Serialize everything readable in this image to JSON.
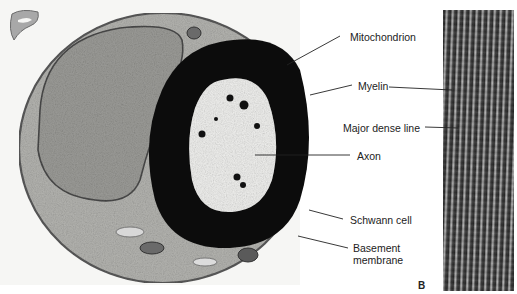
{
  "figure": {
    "panel_label": "B",
    "labels": {
      "mitochondrion": "Mitochondrion",
      "myelin": "Myelin",
      "major_dense_line": "Major dense line",
      "axon": "Axon",
      "schwann_cell": "Schwann cell",
      "basement_membrane_line1": "Basement",
      "basement_membrane_line2": "membrane"
    },
    "colors": {
      "background": "#ffffff",
      "myelin": "#0a0a0a",
      "cytoplasm": "#b8b8b8",
      "axoplasm": "#f2f2f2",
      "label_text": "#222222"
    }
  }
}
